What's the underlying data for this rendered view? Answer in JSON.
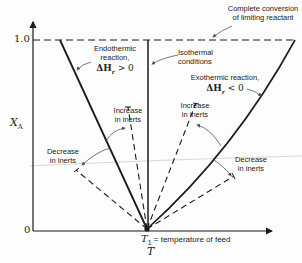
{
  "diagram": {
    "type": "conversion-temperature diagram",
    "axes": {
      "y_label": "X",
      "y_label_sub": "A",
      "y_tick_top": "1.0",
      "y_tick_bottom": "0",
      "x_label": "T"
    },
    "feed_point": {
      "symbol": "T",
      "symbol_sub": "1",
      "text": " = temperature of feed"
    },
    "annotations": {
      "complete_conversion_line1": "Complete conversion",
      "complete_conversion_line2": "of limiting reactant",
      "endothermic_line1": "Endothermic",
      "endothermic_line2": "reaction,",
      "endothermic_eq": "ΔH",
      "endothermic_eq_sub": "r",
      "endothermic_eq_rel": " > 0",
      "isothermal_line1": "Isothermal",
      "isothermal_line2": "conditions",
      "exothermic_line1": "Exothermic reaction,",
      "exothermic_eq": "ΔH",
      "exothermic_eq_sub": "r",
      "exothermic_eq_rel": " < 0",
      "increase_inerts_left_1": "Increase",
      "increase_inerts_left_2": "in inerts",
      "decrease_inerts_left_1": "Decrease",
      "decrease_inerts_left_2": "in inerts",
      "increase_inerts_right_1": "Increase",
      "increase_inerts_right_2": "in inerts",
      "decrease_inerts_right_1": "Decrease",
      "decrease_inerts_right_2": "in inerts"
    },
    "colors": {
      "line": "#1a1a1a",
      "background": "#fdfdfd",
      "arrow": "#555555"
    }
  }
}
